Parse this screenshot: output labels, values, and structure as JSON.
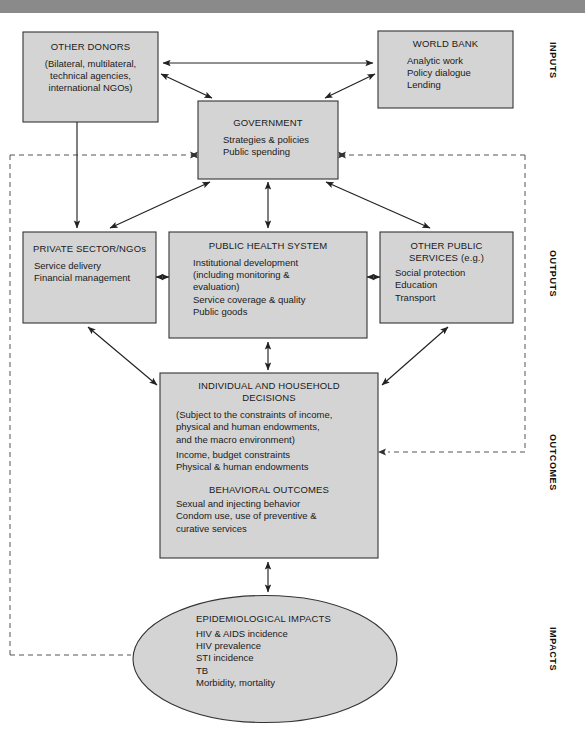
{
  "diagram": {
    "colors": {
      "node_fill": "#d4d4d4",
      "node_stroke": "#333333",
      "arrow": "#222222",
      "dashed": "#555555",
      "topbar": "#8a8a8a"
    },
    "nodes": [
      {
        "id": "other-donors",
        "title": "OTHER DONORS",
        "lines": [
          "(Bilateral, multilateral,",
          "technical agencies,",
          "international NGOs)"
        ],
        "align": "center",
        "shape": "rect"
      },
      {
        "id": "world-bank",
        "title": "WORLD BANK",
        "lines": [
          "Analytic work",
          "Policy dialogue",
          "Lending"
        ],
        "align": "left",
        "shape": "rect"
      },
      {
        "id": "government",
        "title": "GOVERNMENT",
        "lines": [
          "Strategies & policies",
          "Public spending"
        ],
        "align": "left",
        "shape": "rect"
      },
      {
        "id": "private-sector-ngos",
        "title": "PRIVATE SECTOR/NGOs",
        "lines": [
          "Service delivery",
          "Financial management"
        ],
        "align": "left",
        "shape": "rect"
      },
      {
        "id": "public-health-system",
        "title": "PUBLIC HEALTH SYSTEM",
        "lines": [
          "Institutional development",
          "(including monitoring &",
          "evaluation)",
          "Service coverage & quality",
          "Public goods"
        ],
        "align": "left",
        "shape": "rect"
      },
      {
        "id": "other-public-services",
        "title": "OTHER PUBLIC",
        "title2": "SERVICES (e.g.)",
        "lines": [
          "Social protection",
          "Education",
          "Transport"
        ],
        "align": "left",
        "shape": "rect"
      },
      {
        "id": "individual-household-decisions",
        "title": "INDIVIDUAL AND HOUSEHOLD",
        "title2": "DECISIONS",
        "lines": [
          "(Subject to the constraints of income,",
          "physical and human endowments,",
          "and the macro environment)",
          "Income, budget constraints",
          "Physical & human endowments"
        ],
        "subtitle": "BEHAVIORAL OUTCOMES",
        "lines2": [
          "Sexual and injecting behavior",
          "Condom use, use of preventive &",
          "curative services"
        ],
        "align": "left",
        "shape": "rect"
      },
      {
        "id": "epidemiological-impacts",
        "title": "EPIDEMIOLOGICAL IMPACTS",
        "lines": [
          "HIV & AIDS incidence",
          "HIV prevalence",
          "STI incidence",
          "TB",
          "Morbidity, mortality"
        ],
        "align": "left",
        "shape": "ellipse"
      }
    ],
    "side_labels": [
      {
        "id": "inputs",
        "text": "INPUTS"
      },
      {
        "id": "outputs",
        "text": "OUTPUTS"
      },
      {
        "id": "outcomes",
        "text": "OUTCOMES"
      },
      {
        "id": "impacts",
        "text": "IMPACTS"
      }
    ]
  }
}
